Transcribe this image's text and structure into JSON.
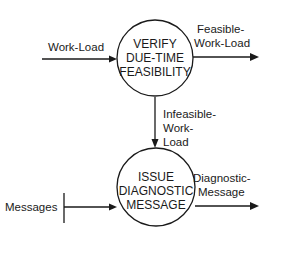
{
  "diagram": {
    "type": "data-flow-diagram",
    "processes": [
      {
        "id": "verify",
        "lines": [
          "VERIFY",
          "DUE-TIME",
          "FEASIBILITY"
        ]
      },
      {
        "id": "issue",
        "lines": [
          "ISSUE",
          "DIAGNOSTIC",
          "MESSAGE"
        ]
      }
    ],
    "flows": [
      {
        "id": "work-load",
        "from": "external",
        "to": "verify",
        "lines": [
          "Work-Load"
        ]
      },
      {
        "id": "feasible-work-load",
        "from": "verify",
        "to": "external",
        "lines": [
          "Feasible-",
          "Work-Load"
        ]
      },
      {
        "id": "infeasible-work-load",
        "from": "verify",
        "to": "issue",
        "lines": [
          "Infeasible-",
          "Work-",
          "Load"
        ]
      },
      {
        "id": "messages",
        "from": "store",
        "to": "issue",
        "lines": [
          "Messages"
        ]
      },
      {
        "id": "diagnostic-message",
        "from": "issue",
        "to": "external",
        "lines": [
          "Diagnostic-",
          "Message"
        ]
      }
    ],
    "colors": {
      "line": "#1a1a1a",
      "background": "#ffffff"
    }
  }
}
